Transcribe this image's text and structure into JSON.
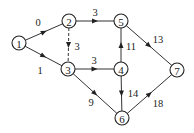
{
  "diagram": {
    "type": "directed-weighted-graph",
    "nodes": [
      {
        "id": "1",
        "label": "1",
        "x": 19,
        "y": 43
      },
      {
        "id": "2",
        "label": "2",
        "x": 69,
        "y": 21
      },
      {
        "id": "3",
        "label": "3",
        "x": 68,
        "y": 69
      },
      {
        "id": "4",
        "label": "4",
        "x": 121,
        "y": 69
      },
      {
        "id": "5",
        "label": "5",
        "x": 121,
        "y": 21
      },
      {
        "id": "6",
        "label": "6",
        "x": 122,
        "y": 118
      },
      {
        "id": "7",
        "label": "7",
        "x": 177,
        "y": 70
      }
    ],
    "edges": [
      {
        "from": "1",
        "to": "2",
        "weight": "0",
        "style": "solid",
        "label_x": 38,
        "label_y": 22
      },
      {
        "from": "1",
        "to": "3",
        "weight": "1",
        "style": "solid",
        "label_x": 40,
        "label_y": 70
      },
      {
        "from": "2",
        "to": "5",
        "weight": "3",
        "style": "solid",
        "label_x": 95,
        "label_y": 12
      },
      {
        "from": "2",
        "to": "3",
        "weight": "3",
        "style": "dashed",
        "label_x": 77,
        "label_y": 46
      },
      {
        "from": "3",
        "to": "4",
        "weight": "3",
        "style": "solid",
        "label_x": 94,
        "label_y": 60
      },
      {
        "from": "3",
        "to": "6",
        "weight": "9",
        "style": "solid",
        "label_x": 91,
        "label_y": 102
      },
      {
        "from": "4",
        "to": "5",
        "weight": "11",
        "style": "solid",
        "label_x": 131,
        "label_y": 46
      },
      {
        "from": "4",
        "to": "6",
        "weight": "14",
        "style": "solid",
        "label_x": 133,
        "label_y": 93
      },
      {
        "from": "5",
        "to": "7",
        "weight": "13",
        "style": "solid",
        "label_x": 158,
        "label_y": 39
      },
      {
        "from": "6",
        "to": "7",
        "weight": "18",
        "style": "solid",
        "label_x": 158,
        "label_y": 103
      }
    ]
  }
}
